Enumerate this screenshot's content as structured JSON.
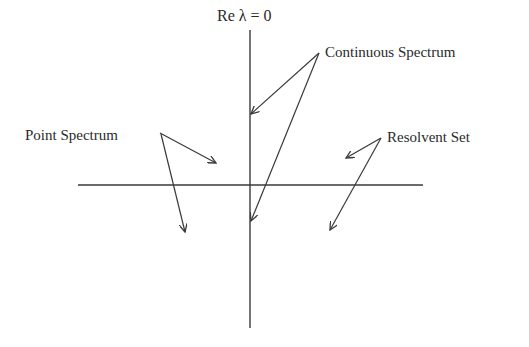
{
  "diagram": {
    "axis_label": "Re λ = 0",
    "labels": {
      "point_spectrum": "Point Spectrum",
      "continuous_spectrum": "Continuous Spectrum",
      "resolvent_set": "Resolvent Set"
    },
    "colors": {
      "line": "#3a3a3a",
      "text": "#2a2a2a",
      "background": "#ffffff"
    }
  }
}
